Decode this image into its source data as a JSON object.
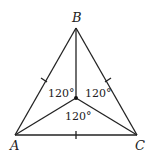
{
  "diagram": {
    "type": "triangle-with-interior-point",
    "vertices": {
      "A": {
        "label": "A",
        "x": 15,
        "y": 135
      },
      "B": {
        "label": "B",
        "x": 76,
        "y": 28
      },
      "C": {
        "label": "C",
        "x": 137,
        "y": 135
      }
    },
    "interior_point": {
      "x": 76,
      "y": 98
    },
    "angles": [
      {
        "between": "A-P-B",
        "label": "120°"
      },
      {
        "between": "B-P-C",
        "label": "120°"
      },
      {
        "between": "A-P-C",
        "label": "120°"
      }
    ],
    "congruent_sides_ticks": [
      "AB",
      "BC",
      "AC"
    ]
  }
}
